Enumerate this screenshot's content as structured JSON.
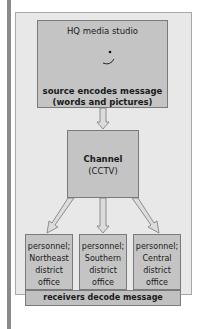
{
  "source": {
    "title": "HQ media studio",
    "caption_line1": "source encodes message",
    "caption_line2": "(words and pictures)"
  },
  "channel": {
    "title": "Channel",
    "subtitle": "(CCTV)"
  },
  "receivers": [
    {
      "line1": "personnel;",
      "line2": "Northeast",
      "line3": "district",
      "line4": "office"
    },
    {
      "line1": "personnel;",
      "line2": "Southern",
      "line3": "district",
      "line4": "office"
    },
    {
      "line1": "personnel;",
      "line2": "Central",
      "line3": "district",
      "line4": "office"
    }
  ],
  "receivers_caption": "receivers decode message",
  "colors": {
    "box_fill": "#c4c4c4",
    "frame_fill": "#e8e8e8",
    "border": "#7a7a7a"
  }
}
